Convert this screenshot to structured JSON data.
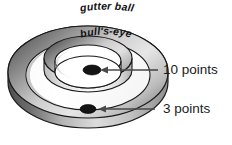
{
  "figure": {
    "background_color": "#ffffff",
    "width": 232,
    "height": 145
  },
  "rings": [
    {
      "id": "outer-ring",
      "label": "gutter ball",
      "role": "outer torus ring",
      "points": 3,
      "fill_light": "#f2f2f2",
      "fill_dark": "#6e6e6e",
      "stroke": "#1a1a1a"
    },
    {
      "id": "inner-ring",
      "label": "bull's-eye",
      "role": "inner torus ring",
      "points": 10,
      "fill_light": "#f2f2f2",
      "fill_dark": "#6e6e6e",
      "stroke": "#1a1a1a"
    }
  ],
  "balls": [
    {
      "id": "bullseye-ball",
      "zone": "bull's-eye",
      "color": "#141414",
      "cx": 92,
      "cy": 70,
      "rx": 9,
      "ry": 5
    },
    {
      "id": "gutter-ball",
      "zone": "gutter ball",
      "color": "#141414",
      "cx": 88,
      "cy": 109,
      "rx": 8,
      "ry": 4.5
    }
  ],
  "callouts": [
    {
      "id": "callout-10-points",
      "text": "10 points",
      "arrow_color": "#4a4a4a",
      "target_zone": "bull's-eye",
      "text_x": 163,
      "text_y": 70
    },
    {
      "id": "callout-3-points",
      "text": "3 points",
      "arrow_color": "#4a4a4a",
      "target_zone": "gutter ball",
      "text_x": 163,
      "text_y": 109
    }
  ],
  "colors": {
    "stroke": "#1a1a1a",
    "ring_light": "#f4f4f4",
    "ring_mid": "#bdbdbd",
    "ring_dark": "#5f5f5f",
    "ball": "#141414",
    "text": "#1a1a1a",
    "arrow": "#4a4a4a"
  }
}
